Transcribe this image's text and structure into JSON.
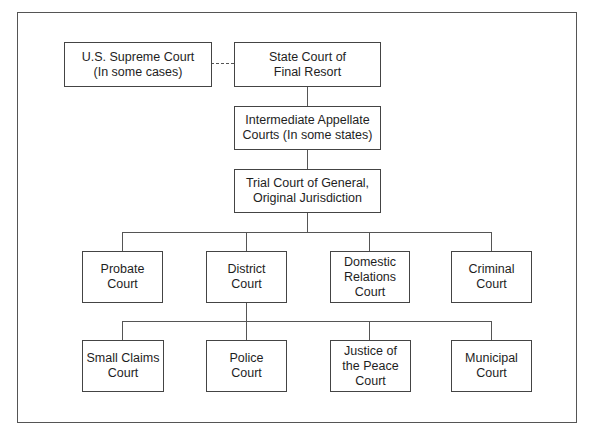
{
  "diagram": {
    "type": "org-chart",
    "title": "",
    "nodes": [
      {
        "id": "us_supreme",
        "label": "U.S. Supreme Court\n(In some cases)"
      },
      {
        "id": "state_final",
        "label": "State Court of\nFinal Resort"
      },
      {
        "id": "intermediate",
        "label": "Intermediate Appellate\nCourts (In some states)"
      },
      {
        "id": "trial",
        "label": "Trial Court of General,\nOriginal Jurisdiction"
      },
      {
        "id": "probate",
        "label": "Probate\nCourt"
      },
      {
        "id": "district",
        "label": "District\nCourt"
      },
      {
        "id": "domestic",
        "label": "Domestic\nRelations\nCourt"
      },
      {
        "id": "criminal",
        "label": "Criminal\nCourt"
      },
      {
        "id": "small_claims",
        "label": "Small Claims\nCourt"
      },
      {
        "id": "police",
        "label": "Police\nCourt"
      },
      {
        "id": "justice_peace",
        "label": "Justice of\nthe Peace\nCourt"
      },
      {
        "id": "municipal",
        "label": "Municipal\nCourt"
      }
    ],
    "edges": [
      {
        "from": "us_supreme",
        "to": "state_final",
        "style": "dashed"
      },
      {
        "from": "state_final",
        "to": "intermediate",
        "style": "solid"
      },
      {
        "from": "intermediate",
        "to": "trial",
        "style": "solid"
      },
      {
        "from": "trial",
        "to": "probate",
        "style": "solid"
      },
      {
        "from": "trial",
        "to": "district",
        "style": "solid"
      },
      {
        "from": "trial",
        "to": "domestic",
        "style": "solid"
      },
      {
        "from": "trial",
        "to": "criminal",
        "style": "solid"
      },
      {
        "from": "district",
        "to": "small_claims",
        "style": "solid"
      },
      {
        "from": "district",
        "to": "police",
        "style": "solid"
      },
      {
        "from": "district",
        "to": "justice_peace",
        "style": "solid"
      },
      {
        "from": "district",
        "to": "municipal",
        "style": "solid"
      }
    ]
  },
  "labels": {
    "us_supreme": "U.S. Supreme Court\n(In some cases)",
    "state_final": "State Court of\nFinal Resort",
    "intermediate": "Intermediate Appellate\nCourts (In some states)",
    "trial": "Trial Court of General,\nOriginal Jurisdiction",
    "probate": "Probate\nCourt",
    "district": "District\nCourt",
    "domestic": "Domestic\nRelations\nCourt",
    "criminal": "Criminal\nCourt",
    "small_claims": "Small Claims\nCourt",
    "police": "Police\nCourt",
    "justice_peace": "Justice of\nthe Peace\nCourt",
    "municipal": "Municipal\nCourt"
  }
}
